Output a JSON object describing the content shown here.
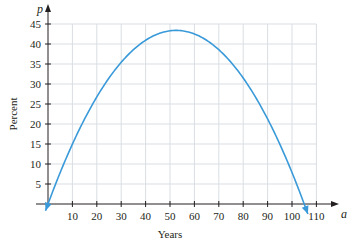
{
  "chart_data": {
    "type": "line",
    "title": "",
    "xlabel": "Years",
    "ylabel": "Percent",
    "x_var": "a",
    "y_var": "p",
    "xlim": [
      0,
      110
    ],
    "ylim": [
      0,
      45
    ],
    "x_ticks": [
      10,
      20,
      30,
      40,
      50,
      60,
      70,
      80,
      90,
      100,
      110
    ],
    "x_tick_labels": [
      "10",
      "20",
      "30",
      "40",
      "50",
      "60",
      "70",
      "80",
      "90",
      "100",
      "110"
    ],
    "y_ticks": [
      5,
      10,
      15,
      20,
      25,
      30,
      35,
      40,
      45
    ],
    "y_tick_labels": [
      "5",
      "10",
      "15",
      "20",
      "25",
      "30",
      "35",
      "40",
      "45"
    ],
    "grid": true,
    "legend": null,
    "series": [
      {
        "name": "p(a)",
        "color": "#3a9ad9",
        "x": [
          0,
          10,
          20,
          30,
          40,
          50,
          52.5,
          60,
          70,
          80,
          90,
          100,
          105
        ],
        "y": [
          0,
          15.0,
          26.8,
          35.4,
          40.9,
          43.3,
          43.4,
          42.5,
          38.6,
          31.5,
          21.3,
          8.0,
          0
        ],
        "arrows_at_ends": true
      }
    ],
    "peak": {
      "a": 52.5,
      "p": 43.4
    }
  },
  "colors": {
    "curve": "#3a9ad9",
    "grid": "#d9dee3",
    "axis": "#231f20"
  }
}
